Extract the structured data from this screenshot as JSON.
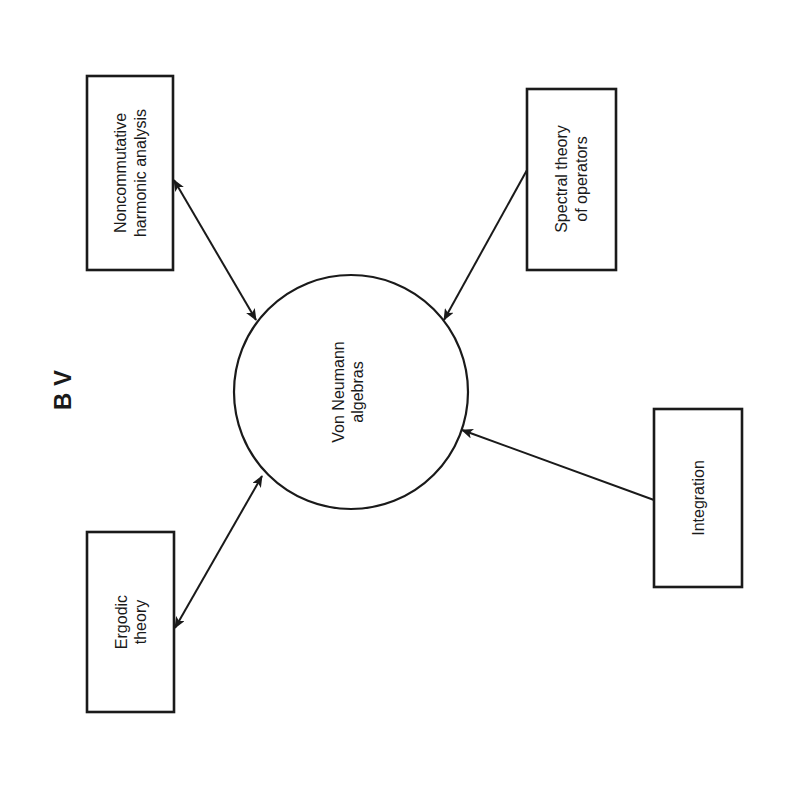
{
  "figure": {
    "label": "B V"
  },
  "center_node": {
    "line1": "Von Neumann",
    "line2": "algebras"
  },
  "nodes": [
    {
      "id": "noncommutative",
      "line1": "Noncommutative",
      "line2": "harmonic analysis",
      "relation": "bidirectional"
    },
    {
      "id": "spectral",
      "line1": "Spectral theory",
      "line2": "of operators",
      "relation": "into-center"
    },
    {
      "id": "integration",
      "line1": "Integration",
      "line2": "",
      "relation": "into-center"
    },
    {
      "id": "ergodic",
      "line1": "Ergodic",
      "line2": "theory",
      "relation": "bidirectional"
    }
  ],
  "colors": {
    "ink": "#1a1a1a",
    "background": "#ffffff"
  }
}
